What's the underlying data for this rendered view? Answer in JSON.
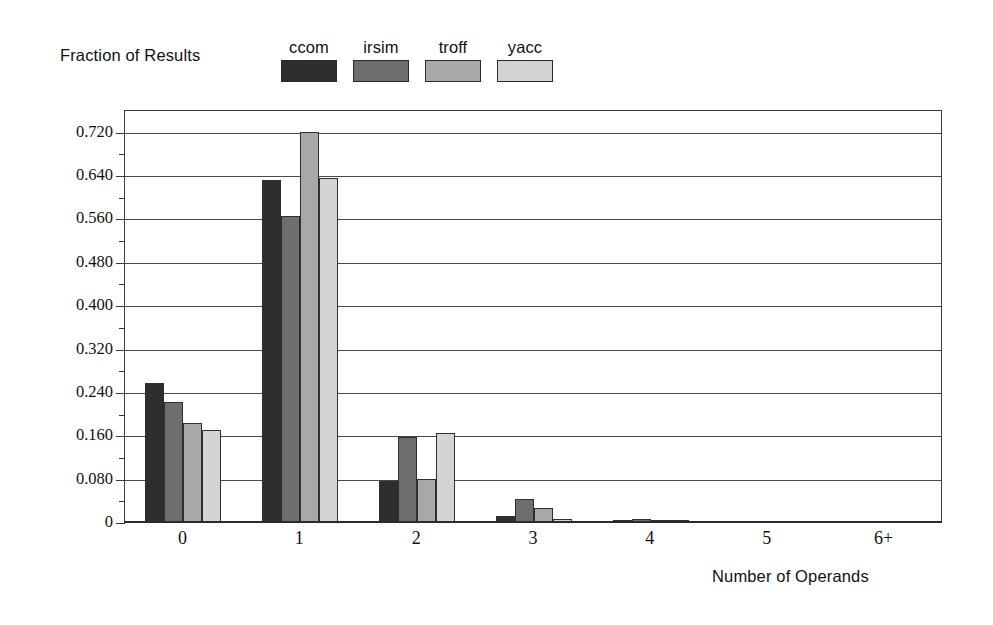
{
  "chart_data": {
    "type": "bar",
    "title": "",
    "ylabel": "Fraction of Results",
    "xlabel": "Number of Operands",
    "categories": [
      "0",
      "1",
      "2",
      "3",
      "4",
      "5",
      "6+"
    ],
    "ylim": [
      0,
      0.76
    ],
    "ytick_labels": [
      "0",
      "0.080",
      "0.160",
      "0.240",
      "0.320",
      "0.400",
      "0.480",
      "0.560",
      "0.640",
      "0.720"
    ],
    "ytick_values": [
      0,
      0.08,
      0.16,
      0.24,
      0.32,
      0.4,
      0.48,
      0.56,
      0.64,
      0.72
    ],
    "yminor_values": [
      0.04,
      0.12,
      0.2,
      0.28,
      0.36,
      0.44,
      0.52,
      0.6,
      0.68
    ],
    "grid": true,
    "legend_position": "top-center",
    "series": [
      {
        "name": "ccom",
        "color": "#2e2e2e",
        "values": [
          0.256,
          0.631,
          0.075,
          0.012,
          0.004,
          0.001,
          0.0
        ]
      },
      {
        "name": "irsim",
        "color": "#6e6e6e",
        "values": [
          0.222,
          0.565,
          0.157,
          0.042,
          0.005,
          0.001,
          0.0
        ]
      },
      {
        "name": "troff",
        "color": "#a8a8a8",
        "values": [
          0.182,
          0.72,
          0.079,
          0.025,
          0.003,
          0.001,
          0.001
        ]
      },
      {
        "name": "yacc",
        "color": "#d4d4d4",
        "values": [
          0.17,
          0.634,
          0.165,
          0.005,
          0.003,
          0.001,
          0.001
        ]
      }
    ]
  },
  "legend": {
    "entries": [
      {
        "label": "ccom"
      },
      {
        "label": "irsim"
      },
      {
        "label": "troff"
      },
      {
        "label": "yacc"
      }
    ]
  }
}
